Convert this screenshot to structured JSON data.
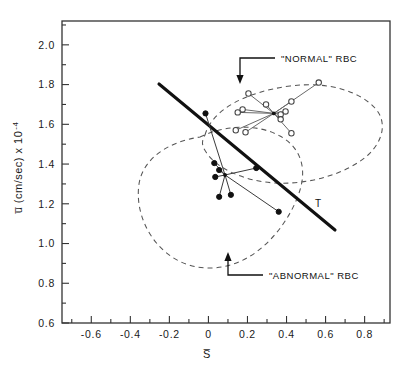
{
  "chart_data": {
    "type": "scatter",
    "title": "",
    "subtitle": "",
    "xlabel": "S̅",
    "ylabel": "u̅ (cm/sec) x 10⁻⁴",
    "xlim": [
      -0.75,
      0.93
    ],
    "ylim": [
      0.6,
      2.12
    ],
    "grid": false,
    "legend": "none",
    "xticks": [
      -0.6,
      -0.4,
      -0.2,
      0,
      0.2,
      0.4,
      0.6,
      0.8
    ],
    "xticklabels": [
      "-0.6",
      "-0.4",
      "-0.2",
      "0",
      "0.2",
      "0.4",
      "0.6",
      "0.8"
    ],
    "xminor_step": 0.1,
    "yticks": [
      0.6,
      0.8,
      1.0,
      1.2,
      1.4,
      1.6,
      1.8,
      2.0
    ],
    "yticklabels": [
      "0.6",
      "0.8",
      "1.0",
      "1.2",
      "1.4",
      "1.6",
      "1.8",
      "2.0"
    ],
    "yminor_step": 0.1,
    "series": [
      {
        "name": "\"NORMAL\" RBC",
        "marker": "open-circle",
        "centroid": {
          "x": 0.335,
          "y": 1.655
        },
        "points": [
          {
            "x": 0.205,
            "y": 1.755
          },
          {
            "x": 0.565,
            "y": 1.81
          },
          {
            "x": 0.425,
            "y": 1.715
          },
          {
            "x": 0.295,
            "y": 1.7
          },
          {
            "x": 0.175,
            "y": 1.675
          },
          {
            "x": 0.15,
            "y": 1.66
          },
          {
            "x": 0.395,
            "y": 1.665
          },
          {
            "x": 0.37,
            "y": 1.65
          },
          {
            "x": 0.37,
            "y": 1.625
          },
          {
            "x": 0.14,
            "y": 1.57
          },
          {
            "x": 0.19,
            "y": 1.56
          },
          {
            "x": 0.425,
            "y": 1.555
          }
        ]
      },
      {
        "name": "\"ABNORMAL\" RBC",
        "marker": "filled-circle",
        "centroid": {
          "x": 0.085,
          "y": 1.345
        },
        "points": [
          {
            "x": -0.015,
            "y": 1.655
          },
          {
            "x": 0.03,
            "y": 1.405
          },
          {
            "x": 0.055,
            "y": 1.37
          },
          {
            "x": 0.035,
            "y": 1.335
          },
          {
            "x": 0.245,
            "y": 1.38
          },
          {
            "x": 0.055,
            "y": 1.235
          },
          {
            "x": 0.115,
            "y": 1.245
          },
          {
            "x": 0.36,
            "y": 1.16
          }
        ]
      }
    ],
    "discriminant_line": {
      "label": "T",
      "p1": {
        "x": -0.205,
        "y": 1.855
      },
      "p2": {
        "x": 0.665,
        "y": 1.07
      }
    },
    "regions": [
      {
        "name": "normal-region",
        "style": "dashed-closed-curve"
      },
      {
        "name": "abnormal-region",
        "style": "dashed-closed-curve"
      }
    ],
    "annotations": [
      {
        "name": "normal-rbc-annotation",
        "text": "\"NORMAL\" RBC",
        "arrow": "down",
        "target": {
          "x": 0.415,
          "y": 1.875
        }
      },
      {
        "name": "abnormal-rbc-annotation",
        "text": "\"ABNORMAL\" RBC",
        "arrow": "up",
        "target": {
          "x": 0.255,
          "y": 0.998
        }
      }
    ]
  },
  "axis": {
    "xlabel": "S̅",
    "ylabel_main": "u̅ (cm/sec) x 10",
    "ylabel_exp": "-4"
  },
  "labels": {
    "line_T": "T",
    "normal": "\"NORMAL\" RBC",
    "abnormal": "\"ABNORMAL\" RBC"
  }
}
